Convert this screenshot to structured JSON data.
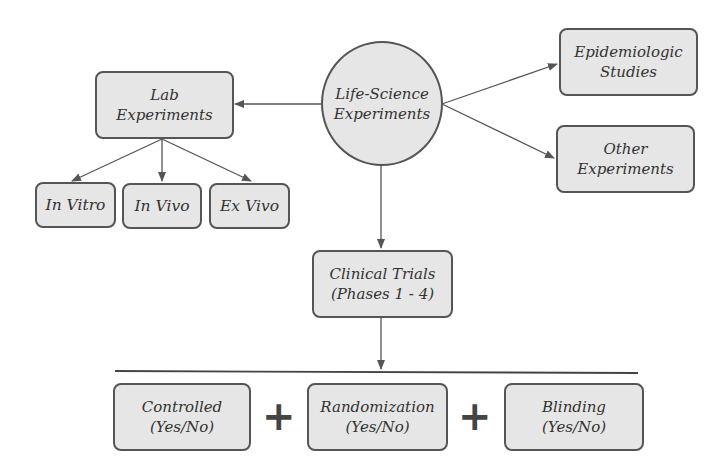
{
  "diagram": {
    "root": {
      "line1": "Life-Science",
      "line2": "Experiments"
    },
    "lab": {
      "line1": "Lab",
      "line2": "Experiments"
    },
    "lab_children": [
      {
        "label": "In Vitro"
      },
      {
        "label": "In Vivo"
      },
      {
        "label": "Ex Vivo"
      }
    ],
    "epidemiologic": {
      "line1": "Epidemiologic",
      "line2": "Studies"
    },
    "other": {
      "line1": "Other",
      "line2": "Experiments"
    },
    "clinical": {
      "line1": "Clinical Trials",
      "line2": "(Phases 1 - 4)"
    },
    "criteria": [
      {
        "line1": "Controlled",
        "line2": "(Yes/No)"
      },
      {
        "line1": "Randomization",
        "line2": "(Yes/No)"
      },
      {
        "line1": "Blinding",
        "line2": "(Yes/No)"
      }
    ],
    "operator": "+"
  },
  "colors": {
    "box_fill": "#e6e6e6",
    "border": "#555555",
    "text": "#333333",
    "arrow": "#555555"
  }
}
